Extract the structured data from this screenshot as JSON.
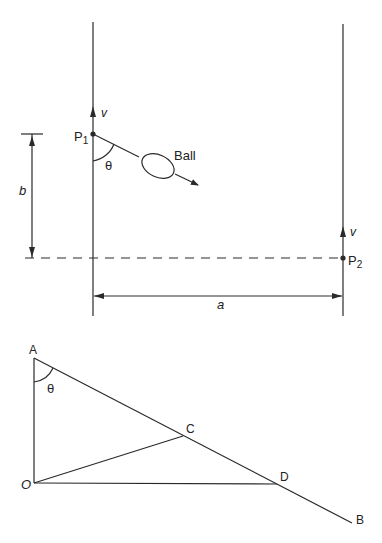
{
  "diagram": {
    "top_figure": {
      "labels": {
        "p1": "P",
        "p1_sub": "1",
        "p2": "P",
        "p2_sub": "2",
        "v_left": "v",
        "v_right": "v",
        "theta": "θ",
        "ball": "Ball",
        "b": "b",
        "a": "a"
      }
    },
    "bottom_figure": {
      "labels": {
        "A": "A",
        "O": "O",
        "C": "C",
        "D": "D",
        "B": "B",
        "theta": "θ"
      }
    },
    "colors": {
      "line": "#2a2a2a",
      "background": "#ffffff"
    }
  }
}
